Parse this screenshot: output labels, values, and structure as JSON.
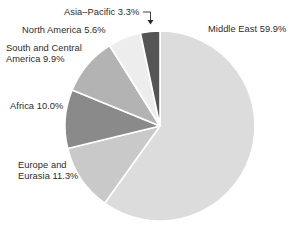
{
  "chart_data": {
    "type": "pie",
    "title": "",
    "subtitle": "",
    "xlabel": "",
    "ylabel": "",
    "legend_position": "none",
    "grid": false,
    "units": "percent",
    "categories": [
      "Middle East",
      "Europe and Eurasia",
      "Africa",
      "South and Central America",
      "North America",
      "Asia–Pacific"
    ],
    "values": [
      59.9,
      11.3,
      10.0,
      9.9,
      5.6,
      3.3
    ],
    "slices": [
      {
        "name": "Middle East",
        "value": 59.9,
        "label": "Middle East 59.9%",
        "color": "#dcdcdc",
        "start_angle_deg": 0.0,
        "end_angle_deg": 215.64,
        "label_position": "right"
      },
      {
        "name": "Europe and Eurasia",
        "value": 11.3,
        "label_line1": "Europe and",
        "label_line2": "Eurasia 11.3%",
        "color": "#c9c9c9",
        "start_angle_deg": 215.64,
        "end_angle_deg": 256.32,
        "label_position": "lower-left"
      },
      {
        "name": "Africa",
        "value": 10.0,
        "label": "Africa 10.0%",
        "color": "#8a8a8a",
        "start_angle_deg": 256.32,
        "end_angle_deg": 292.32,
        "label_position": "left"
      },
      {
        "name": "South and Central America",
        "value": 9.9,
        "label_line1": "South and Central",
        "label_line2": "America 9.9%",
        "color": "#b3b3b3",
        "start_angle_deg": 292.32,
        "end_angle_deg": 327.96,
        "label_position": "upper-left"
      },
      {
        "name": "North America",
        "value": 5.6,
        "label": "North America 5.6%",
        "color": "#ededed",
        "start_angle_deg": 327.96,
        "end_angle_deg": 348.12,
        "label_position": "upper-left"
      },
      {
        "name": "Asia–Pacific",
        "value": 3.3,
        "label": "Asia–Pacific 3.3%",
        "color": "#555555",
        "start_angle_deg": 348.12,
        "end_angle_deg": 360.0,
        "label_position": "top",
        "has_leader_line": true,
        "leader_arrow": "down"
      }
    ],
    "geometry": {
      "center_x": 160,
      "center_y": 126,
      "radius": 95,
      "start_at_top": true,
      "direction": "clockwise",
      "separator_color": "#ffffff",
      "separator_width": 1.6
    },
    "background_color": "#ffffff",
    "text_color": "#2b2b2b"
  }
}
